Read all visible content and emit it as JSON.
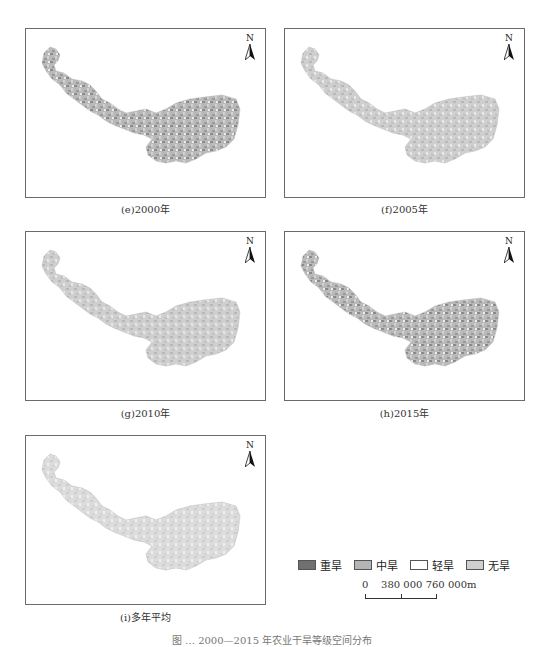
{
  "panels": [
    {
      "id": "e",
      "caption": "(e)2000年",
      "left": 25,
      "top": 28,
      "caption_top": 201,
      "severe_share": "high"
    },
    {
      "id": "f",
      "caption": "(f)2005年",
      "left": 284,
      "top": 28,
      "caption_top": 201,
      "severe_share": "south"
    },
    {
      "id": "g",
      "caption": "(g)2010年",
      "left": 25,
      "top": 231,
      "caption_top": 405,
      "severe_share": "south"
    },
    {
      "id": "h",
      "caption": "(h)2015年",
      "left": 284,
      "top": 231,
      "caption_top": 405,
      "severe_share": "mixed"
    },
    {
      "id": "i",
      "caption": "(i)多年平均",
      "left": 25,
      "top": 435,
      "caption_top": 609,
      "severe_share": "south-light"
    }
  ],
  "north_arrow": {
    "label": "N"
  },
  "legend": {
    "items": [
      {
        "label": "重旱",
        "color": "#707070"
      },
      {
        "label": "中旱",
        "color": "#b4b4b4"
      },
      {
        "label": "轻旱",
        "color": "#ffffff"
      },
      {
        "label": "无旱",
        "color": "#cfcfcf"
      }
    ]
  },
  "scale_bar": {
    "labels": [
      "0",
      "380 000",
      "760 000m"
    ]
  },
  "figure_caption": "图 … 2000—2015 年农业干旱等级空间分布"
}
